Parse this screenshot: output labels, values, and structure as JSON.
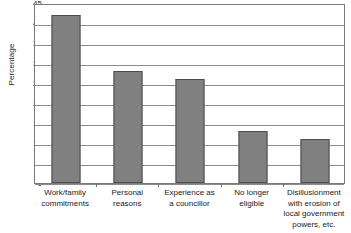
{
  "chart_data": {
    "type": "bar",
    "title": "",
    "xlabel": "",
    "ylabel": "Percentage",
    "ylim": [
      0,
      45
    ],
    "ytick_step": 5,
    "yticks": [
      45,
      40,
      35,
      30,
      25,
      20,
      15,
      10,
      5,
      0
    ],
    "grid": true,
    "legend": "none",
    "bar_color": "#808080",
    "bar_border_color": "#4d4d4d",
    "categories": [
      "Work/family\ncommitments",
      "Personal\nreasons",
      "Experience as\na councillor",
      "No longer\neligible",
      "Disillusionment\nwith erosion of\nlocal government\npowers, etc."
    ],
    "values": [
      42,
      28,
      26,
      13,
      11
    ]
  },
  "axes": {
    "y_title": "Percentage"
  }
}
